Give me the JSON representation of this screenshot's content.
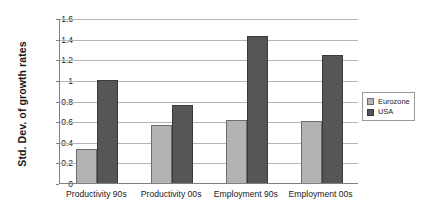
{
  "chart_data": {
    "type": "bar",
    "title": "",
    "subtitle": "",
    "xlabel": "",
    "ylabel": "Std. Dev. of growth rates",
    "ylim": [
      0,
      1.6
    ],
    "ytick_labels": [
      "1.6",
      "1.4",
      "1.2",
      "1",
      "0.8",
      "0.6",
      "0.4",
      "0.2",
      "0"
    ],
    "ytick_values": [
      1.6,
      1.4,
      1.2,
      1.0,
      0.8,
      0.6,
      0.4,
      0.2,
      0
    ],
    "grid": true,
    "grid_axis": "y",
    "legend_position": "right",
    "categories": [
      "Productivity 90s",
      "Productivity 00s",
      "Employment 90s",
      "Employment 00s"
    ],
    "series": [
      {
        "name": "Eurozone",
        "color": "#b3b3b3",
        "values": [
          0.33,
          0.56,
          0.61,
          0.6
        ]
      },
      {
        "name": "USA",
        "color": "#565656",
        "values": [
          1.0,
          0.76,
          1.43,
          1.24
        ]
      }
    ]
  }
}
